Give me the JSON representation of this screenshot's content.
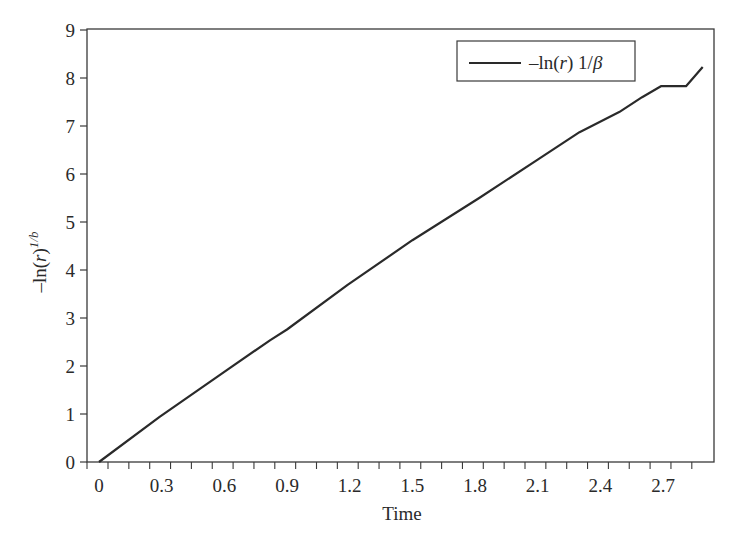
{
  "chart_data": {
    "type": "line",
    "title": "",
    "xlabel": "Time",
    "ylabel": "-ln(r)^{1/b}",
    "ylabel_parts": {
      "main": "–ln(",
      "var": "r",
      "close": ")",
      "sup": "1/b"
    },
    "xlim": [
      -0.06,
      2.95
    ],
    "ylim": [
      0,
      9
    ],
    "grid": false,
    "legend_position": "upper right",
    "x_ticks": [
      0,
      0.3,
      0.6,
      0.9,
      1.2,
      1.5,
      1.8,
      2.1,
      2.4,
      2.7
    ],
    "x_tick_labels": [
      "0",
      "0.3",
      "0.6",
      "0.9",
      "1.2",
      "1.5",
      "1.8",
      "2.1",
      "2.4",
      "2.7"
    ],
    "x_minor_step": 0.1,
    "y_ticks": [
      0,
      1,
      2,
      3,
      4,
      5,
      6,
      7,
      8,
      9
    ],
    "y_tick_labels": [
      "0",
      "1",
      "2",
      "3",
      "4",
      "5",
      "6",
      "7",
      "8",
      "9"
    ],
    "series": [
      {
        "name": "–ln(r) 1/β",
        "legend_parts": {
          "pre": "–ln(",
          "var": "r",
          "post": ") 1/",
          "greek": "β"
        },
        "color": "#2a2a2a",
        "x": [
          0.0,
          0.29,
          0.6,
          0.82,
          0.9,
          1.19,
          1.5,
          1.82,
          2.1,
          2.3,
          2.49,
          2.6,
          2.69,
          2.81,
          2.89
        ],
        "y": [
          0.0,
          0.94,
          1.88,
          2.54,
          2.76,
          3.69,
          4.62,
          5.5,
          6.3,
          6.87,
          7.29,
          7.6,
          7.83,
          7.83,
          8.23
        ]
      }
    ]
  }
}
